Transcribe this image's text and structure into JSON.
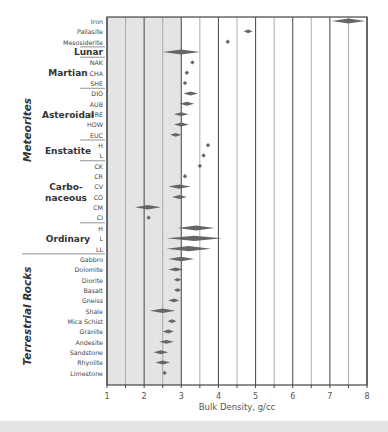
{
  "chart_data": {
    "type": "scatter",
    "title": "",
    "xlabel": "Bulk Density, g/cc",
    "ylabel": "",
    "xlim": [
      1,
      8
    ],
    "xticks": [
      1,
      2,
      3,
      4,
      5,
      6,
      7,
      8
    ],
    "shaded_region": [
      1,
      3
    ],
    "grid": "vertical every 0.5",
    "groups": [
      {
        "name": "Meteorites",
        "subgroups": [
          {
            "name": "",
            "rows": [
              {
                "label": "Iron",
                "center": 7.5,
                "spread": 0.45
              },
              {
                "label": "Pallasite",
                "center": 4.8,
                "spread": 0.12
              },
              {
                "label": "Mesosiderite",
                "center": 4.25,
                "spread": 0
              }
            ]
          },
          {
            "name": "Lunar",
            "rows": [
              {
                "label": "Lunar",
                "center": 3.0,
                "spread": 0.5,
                "bold": true
              }
            ]
          },
          {
            "name": "Martian",
            "rows": [
              {
                "label": "NAK",
                "center": 3.3,
                "spread": 0
              },
              {
                "label": "CHA",
                "center": 3.15,
                "spread": 0
              },
              {
                "label": "SHE",
                "center": 3.1,
                "spread": 0
              }
            ]
          },
          {
            "name": "Asteroidal",
            "rows": [
              {
                "label": "DIO",
                "center": 3.25,
                "spread": 0.2
              },
              {
                "label": "AUB",
                "center": 3.15,
                "spread": 0.2
              },
              {
                "label": "URE",
                "center": 3.0,
                "spread": 0.2
              },
              {
                "label": "HOW",
                "center": 3.0,
                "spread": 0.2
              },
              {
                "label": "EUC",
                "center": 2.85,
                "spread": 0.15
              }
            ]
          },
          {
            "name": "Enstatite",
            "rows": [
              {
                "label": "H",
                "center": 3.72,
                "spread": 0
              },
              {
                "label": "L",
                "center": 3.6,
                "spread": 0
              }
            ]
          },
          {
            "name": "Carbo-\nnaceous",
            "rows": [
              {
                "label": "CK",
                "center": 3.5,
                "spread": 0
              },
              {
                "label": "CR",
                "center": 3.1,
                "spread": 0
              },
              {
                "label": "CV",
                "center": 2.95,
                "spread": 0.3
              },
              {
                "label": "CO",
                "center": 2.95,
                "spread": 0.2
              },
              {
                "label": "CM",
                "center": 2.1,
                "spread": 0.35
              },
              {
                "label": "CI",
                "center": 2.12,
                "spread": 0
              }
            ]
          },
          {
            "name": "Ordinary",
            "rows": [
              {
                "label": "H",
                "center": 3.4,
                "spread": 0.5
              },
              {
                "label": "L",
                "center": 3.35,
                "spread": 0.75
              },
              {
                "label": "LL",
                "center": 3.2,
                "spread": 0.6
              }
            ]
          }
        ]
      },
      {
        "name": "Terrestrial Rocks",
        "subgroups": [
          {
            "name": "",
            "rows": [
              {
                "label": "Gabbro",
                "center": 3.0,
                "spread": 0.35
              },
              {
                "label": "Dolomite",
                "center": 2.85,
                "spread": 0.2
              },
              {
                "label": "Diorite",
                "center": 2.9,
                "spread": 0.1
              },
              {
                "label": "Basalt",
                "center": 2.9,
                "spread": 0.1
              },
              {
                "label": "Gneiss",
                "center": 2.8,
                "spread": 0.15
              },
              {
                "label": "Shale",
                "center": 2.5,
                "spread": 0.35
              },
              {
                "label": "Mica Schist",
                "center": 2.75,
                "spread": 0.12
              },
              {
                "label": "Granite",
                "center": 2.65,
                "spread": 0.15
              },
              {
                "label": "Andesite",
                "center": 2.6,
                "spread": 0.2
              },
              {
                "label": "Sandstone",
                "center": 2.45,
                "spread": 0.2
              },
              {
                "label": "Rhyolite",
                "center": 2.5,
                "spread": 0.2
              },
              {
                "label": "Limestone",
                "center": 2.55,
                "spread": 0
              }
            ]
          }
        ]
      }
    ]
  },
  "colors": {
    "shade": "#e4e4e4",
    "grid_major": "#555555",
    "grid_minor": "#999999",
    "marker": "#666666",
    "text": "#444444",
    "group_text": "#333333"
  }
}
